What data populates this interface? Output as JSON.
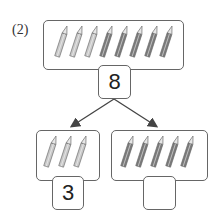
{
  "problem": {
    "label": "(2)",
    "total": {
      "value": "8",
      "pencils": [
        {
          "color": "#c8c8c8"
        },
        {
          "color": "#c8c8c8"
        },
        {
          "color": "#c8c8c8"
        },
        {
          "color": "#7a7a7a"
        },
        {
          "color": "#7a7a7a"
        },
        {
          "color": "#7a7a7a"
        },
        {
          "color": "#7a7a7a"
        },
        {
          "color": "#7a7a7a"
        }
      ]
    },
    "left_part": {
      "value": "3",
      "pencil_count": 3,
      "pencil_color": "#c8c8c8"
    },
    "right_part": {
      "value": "",
      "pencil_count": 5,
      "pencil_color": "#7a7a7a"
    }
  }
}
